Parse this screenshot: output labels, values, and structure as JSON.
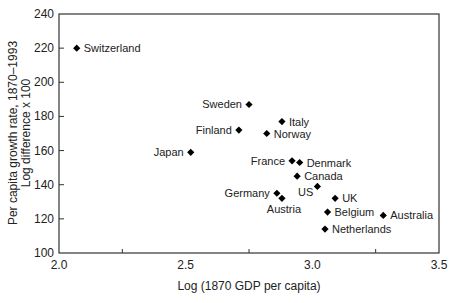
{
  "chart_data": {
    "type": "scatter",
    "title": "",
    "xlabel": "Log (1870 GDP per capita)",
    "ylabel_line1": "Per capita growth rate, 1870–1993",
    "ylabel_line2": "Log difference x 100",
    "xlim": [
      2.0,
      3.5
    ],
    "ylim": [
      100,
      240
    ],
    "xticks": [
      2.0,
      2.5,
      3.0,
      3.5
    ],
    "xtick_labels": [
      "2.0",
      "2.5",
      "3.0",
      "3.5"
    ],
    "x_minor_ticks": [
      2.25,
      2.75,
      3.25
    ],
    "yticks": [
      100,
      120,
      140,
      160,
      180,
      200,
      220,
      240
    ],
    "ytick_labels": [
      "100",
      "120",
      "140",
      "160",
      "180",
      "200",
      "220",
      "240"
    ],
    "grid": false,
    "legend": null,
    "marker": "diamond",
    "marker_color": "#000000",
    "points": [
      {
        "label": "Switzerland",
        "x": 2.07,
        "y": 220,
        "label_pos": "right"
      },
      {
        "label": "Sweden",
        "x": 2.75,
        "y": 187,
        "label_pos": "left"
      },
      {
        "label": "Finland",
        "x": 2.71,
        "y": 172,
        "label_pos": "left"
      },
      {
        "label": "Italy",
        "x": 2.88,
        "y": 177,
        "label_pos": "right"
      },
      {
        "label": "Norway",
        "x": 2.82,
        "y": 170,
        "label_pos": "right"
      },
      {
        "label": "Japan",
        "x": 2.52,
        "y": 159,
        "label_pos": "left"
      },
      {
        "label": "France",
        "x": 2.92,
        "y": 154,
        "label_pos": "left"
      },
      {
        "label": "Denmark",
        "x": 2.95,
        "y": 153,
        "label_pos": "right"
      },
      {
        "label": "Canada",
        "x": 2.94,
        "y": 145,
        "label_pos": "right"
      },
      {
        "label": "US",
        "x": 3.02,
        "y": 139,
        "label_pos": "below-left"
      },
      {
        "label": "Germany",
        "x": 2.86,
        "y": 135,
        "label_pos": "left"
      },
      {
        "label": "Austria",
        "x": 2.88,
        "y": 132,
        "label_pos": "below"
      },
      {
        "label": "UK",
        "x": 3.09,
        "y": 132,
        "label_pos": "right"
      },
      {
        "label": "Belgium",
        "x": 3.06,
        "y": 124,
        "label_pos": "right"
      },
      {
        "label": "Australia",
        "x": 3.28,
        "y": 122,
        "label_pos": "right"
      },
      {
        "label": "Netherlands",
        "x": 3.05,
        "y": 114,
        "label_pos": "right"
      }
    ]
  }
}
